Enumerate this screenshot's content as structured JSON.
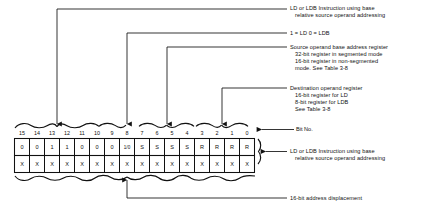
{
  "diagram": {
    "bit_numbers": [
      "15",
      "14",
      "13",
      "12",
      "11",
      "10",
      "9",
      "8",
      "7",
      "6",
      "5",
      "4",
      "3",
      "2",
      "1",
      "0"
    ],
    "word1_cells": [
      "0",
      "0",
      "1",
      "1",
      "0",
      "0",
      "0",
      "1/0",
      "S",
      "S",
      "S",
      "S",
      "R",
      "R",
      "R",
      "R"
    ],
    "word2_cells": [
      "X",
      "X",
      "X",
      "X",
      "X",
      "X",
      "X",
      "X",
      "X",
      "X",
      "X",
      "X",
      "X",
      "X",
      "X",
      "X"
    ],
    "bit_no_label": "Bit No.",
    "annotations": {
      "opcode": {
        "lines": [
          "LD or LDB Instruction using base",
          "relative source operand addressing"
        ]
      },
      "size_bit": {
        "lines": [
          "1 = LD    0 = LDB"
        ]
      },
      "source_register": {
        "lines": [
          "Source operand base address register",
          "32-bit register in segmented mode",
          "16-bit register in non-segmented",
          "mode. See Table 3-8"
        ]
      },
      "destination_register": {
        "lines": [
          "Destination operand register",
          "16-bit register for LD",
          "8-bit register for LDB",
          "See Table 3-8"
        ]
      },
      "word_group": {
        "lines": [
          "LD or LDB Instruction using base",
          "relative source operand addressing"
        ]
      },
      "displacement": {
        "lines": [
          "16-bit address displacement"
        ]
      }
    },
    "colors": {
      "ink": "#111111",
      "background": "#ffffff"
    }
  }
}
